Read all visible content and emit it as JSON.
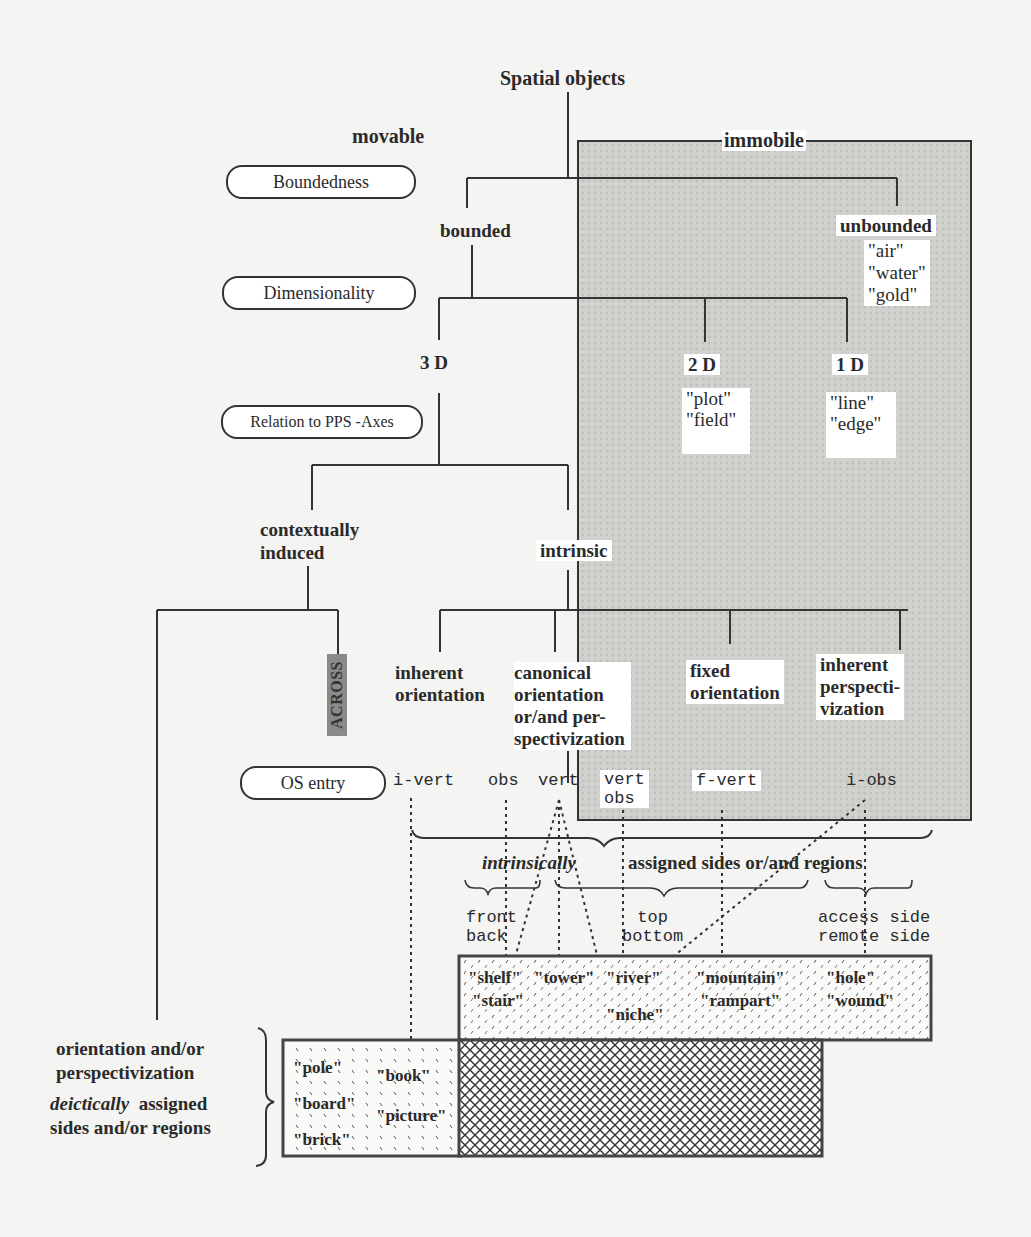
{
  "diagram": {
    "root": "Spatial objects",
    "branches": {
      "movable": "movable",
      "immobile": "immobile"
    },
    "criteria_pills": [
      "Boundedness",
      "Dimensionality",
      "Relation to PPS -Axes",
      "OS entry"
    ],
    "boundedness": {
      "bounded": "bounded",
      "unbounded": "unbounded",
      "unbounded_examples": [
        "\"air\"",
        "\"water\"",
        "\"gold\""
      ]
    },
    "dimensionality": {
      "d3": "3 D",
      "d2": "2 D",
      "d2_examples": [
        "\"plot\"",
        "\"field\""
      ],
      "d1": "1 D",
      "d1_examples": [
        "\"line\"",
        "\"edge\""
      ]
    },
    "relation": {
      "contextual_line1": "contextually",
      "contextual_line2": "induced",
      "intrinsic": "intrinsic",
      "across": "ACROSS"
    },
    "intrinsic_types": [
      {
        "lines": [
          "inherent",
          "orientation"
        ]
      },
      {
        "lines": [
          "canonical",
          "orientation",
          "or/and per-",
          "spectivization"
        ]
      },
      {
        "lines": [
          "fixed",
          "orientation"
        ]
      },
      {
        "lines": [
          "inherent",
          "perspecti-",
          "vization"
        ]
      }
    ],
    "os_entries": {
      "i_vert": "i-vert",
      "obs": "obs",
      "vert": "vert",
      "vert_obs_1": "vert",
      "vert_obs_2": "obs",
      "f_vert": "f-vert",
      "i_obs": "i-obs"
    },
    "assigned": {
      "intrinsically": "intrinsically",
      "rest": "assigned sides or/and regions",
      "front_back": [
        "front",
        "back"
      ],
      "top_bottom": [
        "top",
        "bottom"
      ],
      "access_remote": [
        "access side",
        "remote side"
      ]
    },
    "intrinsic_examples": {
      "row1": [
        "\"shelf\"",
        "\"tower\"",
        "\"river\"",
        "\"mountain\"",
        "\"hole\""
      ],
      "row2": [
        "\"stair\"",
        "\"rampart\"",
        "\"wound\""
      ],
      "row3": [
        "\"niche\""
      ]
    },
    "deictic": {
      "line1": "orientation and/or",
      "line2": "perspectivization",
      "deictically": "deictically",
      "assigned": "assigned",
      "line4": "sides and/or regions",
      "examples_col1": [
        "\"pole\"",
        "\"board\"",
        "\"brick\""
      ],
      "examples_col2": [
        "\"book\"",
        "\"picture\""
      ]
    }
  }
}
